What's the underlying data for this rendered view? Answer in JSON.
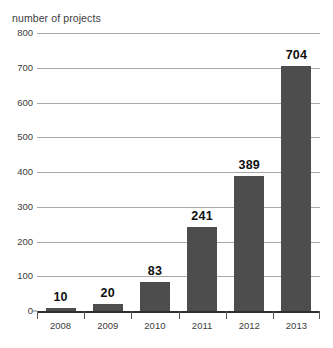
{
  "chart_data": {
    "type": "bar",
    "title": "number of projects",
    "xlabel": "",
    "ylabel": "number of projects",
    "categories": [
      "2008",
      "2009",
      "2010",
      "2011",
      "2012",
      "2013"
    ],
    "values": [
      10,
      20,
      83,
      241,
      389,
      704
    ],
    "value_labels": [
      "10",
      "20",
      "83",
      "241",
      "389",
      "704"
    ],
    "ylim": [
      0,
      800
    ],
    "yticks": [
      0,
      100,
      200,
      300,
      400,
      500,
      600,
      700,
      800
    ],
    "ytick_labels": [
      "0",
      "100",
      "200",
      "300",
      "400",
      "500",
      "600",
      "700",
      "800"
    ],
    "grid": true,
    "legend": false,
    "legend_position": "none",
    "series": [
      {
        "name": "number of projects",
        "values": [
          10,
          20,
          83,
          241,
          389,
          704
        ],
        "color": "#4d4d4d"
      }
    ],
    "colors": {
      "bar": "#4d4d4d",
      "gridline": "#a8a8a8",
      "axis": "#2f2f2f",
      "text": "#3d3d3d",
      "value_label": "#0f0f0f",
      "background": "#ffffff"
    }
  }
}
